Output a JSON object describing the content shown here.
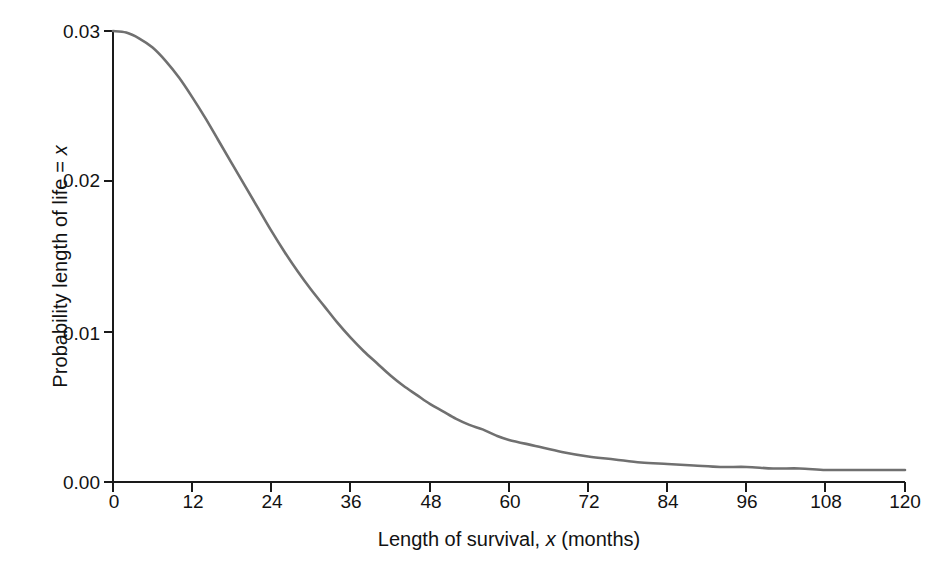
{
  "chart_data": {
    "type": "line",
    "title": "",
    "subtitle": "",
    "xlabel_prefix": "Length of survival, ",
    "xlabel_var": "x",
    "xlabel_suffix": " (months)",
    "ylabel_prefix": "Probability length of life = ",
    "ylabel_var": "x",
    "ylabel_suffix": "",
    "xlim": [
      0,
      120
    ],
    "ylim": [
      0.0,
      0.03
    ],
    "xticks": [
      0,
      12,
      24,
      36,
      48,
      60,
      72,
      84,
      96,
      108,
      120
    ],
    "xticklabels": [
      "0",
      "12",
      "24",
      "36",
      "48",
      "60",
      "72",
      "84",
      "96",
      "108",
      "120"
    ],
    "yticks": [
      0.0,
      0.01,
      0.02,
      0.03
    ],
    "yticklabels": [
      "0.00",
      "0.01",
      "0.02",
      "0.03"
    ],
    "grid": false,
    "legend": false,
    "legend_position": "none",
    "line_color": "#707070",
    "axis_color": "#1a1a1a",
    "background": "#ffffff",
    "series": [
      {
        "name": "Probability density of length of life",
        "x": [
          0,
          2,
          4,
          6,
          8,
          10,
          12,
          14,
          16,
          18,
          20,
          22,
          24,
          26,
          28,
          30,
          32,
          34,
          36,
          38,
          40,
          42,
          44,
          46,
          48,
          50,
          52,
          54,
          56,
          58,
          60,
          64,
          68,
          72,
          76,
          80,
          84,
          88,
          92,
          96,
          100,
          104,
          108,
          112,
          116,
          120
        ],
        "y": [
          0.03,
          0.0299,
          0.0295,
          0.0289,
          0.028,
          0.0269,
          0.0256,
          0.0242,
          0.0227,
          0.0212,
          0.0197,
          0.0182,
          0.0167,
          0.0153,
          0.014,
          0.0128,
          0.0117,
          0.0106,
          0.0096,
          0.0087,
          0.0079,
          0.0071,
          0.0064,
          0.0058,
          0.0052,
          0.0047,
          0.0042,
          0.0038,
          0.0035,
          0.0031,
          0.0028,
          0.0024,
          0.002,
          0.0017,
          0.0015,
          0.0013,
          0.0012,
          0.0011,
          0.001,
          0.001,
          0.0009,
          0.0009,
          0.0008,
          0.0008,
          0.0008,
          0.0008
        ]
      }
    ],
    "annotations": []
  },
  "caption": {
    "text": ""
  }
}
